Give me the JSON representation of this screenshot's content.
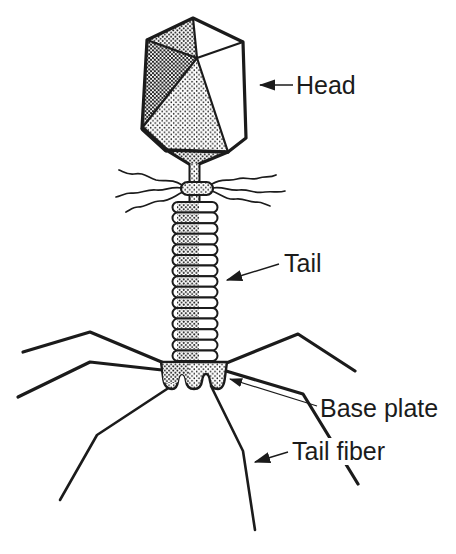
{
  "diagram": {
    "labels": {
      "head": "Head",
      "tail": "Tail",
      "base_plate": "Base plate",
      "tail_fiber": "Tail fiber"
    },
    "colors": {
      "ink": "#1b1b1b",
      "background": "#ffffff"
    }
  }
}
